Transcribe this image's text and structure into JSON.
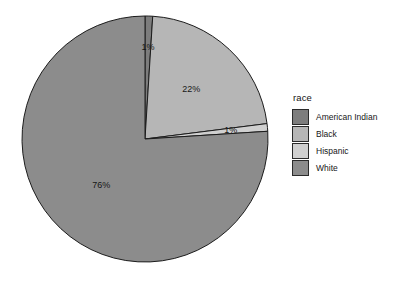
{
  "chart_data": {
    "type": "pie",
    "title": "",
    "xlabel": "",
    "ylabel": "",
    "legend_title": "race",
    "legend_position": "right",
    "grid": false,
    "categories": [
      "American Indian",
      "Black",
      "Hispanic",
      "White"
    ],
    "values": [
      1,
      22,
      1,
      76
    ],
    "labels": [
      "1%",
      "22%",
      "1%",
      "76%"
    ],
    "colors": [
      "#7d7d7d",
      "#b6b6b6",
      "#d0d0d0",
      "#8c8c8c"
    ],
    "slices": [
      {
        "name": "American Indian",
        "value": 1,
        "label": "1%",
        "color": "#7d7d7d"
      },
      {
        "name": "Black",
        "value": 22,
        "label": "22%",
        "color": "#b6b6b6"
      },
      {
        "name": "Hispanic",
        "value": 1,
        "label": "1%",
        "color": "#d0d0d0"
      },
      {
        "name": "White",
        "value": 76,
        "label": "76%",
        "color": "#8c8c8c"
      }
    ],
    "start_angle_deg": 0,
    "direction": "clockwise",
    "outline_color": "#1c1c1c",
    "background": "#ffffff",
    "units": "percent"
  },
  "legend": {
    "title": "race",
    "items": [
      {
        "label": "American Indian",
        "color": "#7d7d7d"
      },
      {
        "label": "Black",
        "color": "#b6b6b6"
      },
      {
        "label": "Hispanic",
        "color": "#d0d0d0"
      },
      {
        "label": "White",
        "color": "#8c8c8c"
      }
    ]
  },
  "pie_labels": {
    "american_indian": "1%",
    "black": "22%",
    "hispanic": "1%",
    "white": "76%"
  }
}
